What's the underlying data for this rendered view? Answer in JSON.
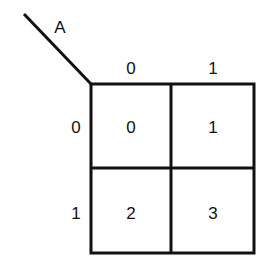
{
  "kmap": {
    "variable_label": "A",
    "column_headers": [
      "0",
      "1"
    ],
    "row_headers": [
      "0",
      "1"
    ],
    "cells": [
      [
        "0",
        "1"
      ],
      [
        "2",
        "3"
      ]
    ],
    "line_color": "#111111"
  }
}
